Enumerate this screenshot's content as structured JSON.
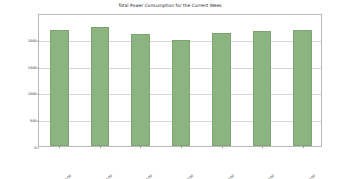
{
  "chart_data": {
    "type": "bar",
    "title": "Total Power Consumption for the Current Week",
    "xlabel": "",
    "ylabel": "Total Power Consumed (kWh)",
    "categories": [
      "2023-10-02 00:00:00",
      "2023-10-03 00:00:00",
      "2023-10-04 00:00:00",
      "2023-10-05 00:00:00",
      "2023-10-06 00:00:00",
      "2023-10-07 00:00:00",
      "2023-10-08 00:00:00"
    ],
    "values": [
      2170,
      2210,
      2090,
      1985,
      2105,
      2140,
      2170
    ],
    "ylim": [
      0,
      2480
    ],
    "yticks": [
      0,
      500,
      1000,
      1500,
      2000
    ],
    "ytick_labels": [
      "0",
      "500",
      "1000",
      "1500",
      "2000"
    ],
    "grid": true,
    "legend": false,
    "bar_color": "#8cb480",
    "bar_edge_color": "#7ea472",
    "background_color": "#ffffff",
    "frame_color": "#b9b9b9",
    "gridline_color": "#d6d6d6",
    "xtick_rotation": -45
  }
}
